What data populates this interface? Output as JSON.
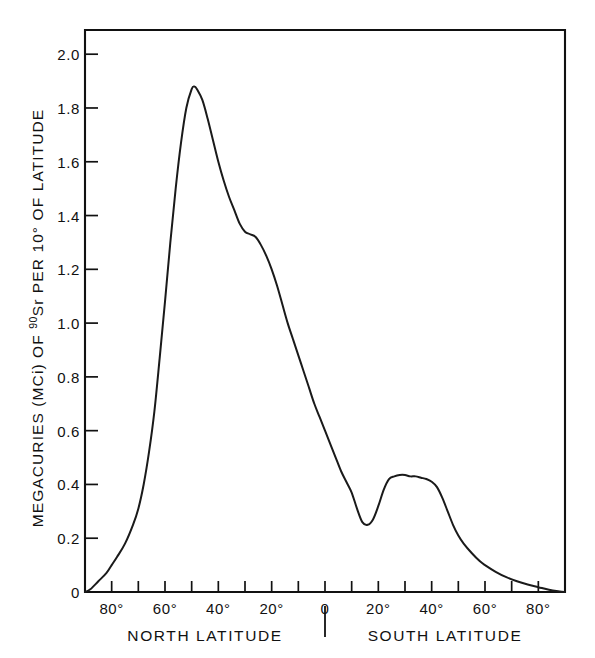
{
  "chart_data": {
    "type": "line",
    "title": "",
    "subtitle": "",
    "xlabel_left": "NORTH LATITUDE",
    "xlabel_right": "SOUTH LATITUDE",
    "ylabel": "MEGACURIES (MCi) OF 90Sr PER 10° OF LATITUDE",
    "ylabel_prefix": "MEGACURIES (MCi) OF ",
    "ylabel_superscript": "90",
    "ylabel_suffix": "Sr PER 10° OF LATITUDE",
    "legend": [],
    "grid": false,
    "xlim": [
      90,
      -90
    ],
    "ylim": [
      0,
      2.09
    ],
    "x_axis_direction": "north-to-south",
    "y_ticks": [
      0,
      0.2,
      0.4,
      0.6,
      0.8,
      1.0,
      1.2,
      1.4,
      1.6,
      1.8,
      2.0
    ],
    "y_tick_labels": [
      "0",
      "0.2",
      "0.4",
      "0.6",
      "0.8",
      "1.0",
      "1.2",
      "1.4",
      "1.6",
      "1.8",
      "2.0"
    ],
    "x_ticks": [
      90,
      80,
      70,
      60,
      50,
      40,
      30,
      20,
      10,
      0,
      -10,
      -20,
      -30,
      -40,
      -50,
      -60,
      -70,
      -80,
      -90
    ],
    "x_labeled_ticks": [
      80,
      60,
      40,
      20,
      0,
      -20,
      -40,
      -60,
      -80
    ],
    "x_tick_labels": [
      "80°",
      "60°",
      "40°",
      "20°",
      "0",
      "20°",
      "40°",
      "60°",
      "80°"
    ],
    "series": [
      {
        "name": "Sr-90 deposition",
        "x": [
          90,
          88,
          85,
          82,
          80,
          78,
          75,
          72,
          70,
          68,
          66,
          64,
          62,
          60,
          58,
          56,
          54,
          52,
          50,
          49,
          48,
          46,
          44,
          42,
          40,
          38,
          36,
          34,
          32,
          30,
          28,
          26,
          24,
          22,
          20,
          18,
          16,
          14,
          12,
          10,
          8,
          6,
          4,
          2,
          0,
          -2,
          -4,
          -6,
          -8,
          -10,
          -12,
          -14,
          -16,
          -18,
          -20,
          -22,
          -24,
          -26,
          -28,
          -30,
          -32,
          -34,
          -36,
          -38,
          -40,
          -42,
          -44,
          -46,
          -48,
          -50,
          -52,
          -55,
          -58,
          -60,
          -64,
          -68,
          -72,
          -76,
          -80,
          -84,
          -88,
          -90
        ],
        "y": [
          0.0,
          0.01,
          0.04,
          0.07,
          0.1,
          0.13,
          0.18,
          0.25,
          0.31,
          0.4,
          0.52,
          0.67,
          0.87,
          1.08,
          1.3,
          1.5,
          1.67,
          1.8,
          1.87,
          1.88,
          1.87,
          1.83,
          1.76,
          1.68,
          1.6,
          1.53,
          1.47,
          1.42,
          1.37,
          1.34,
          1.33,
          1.32,
          1.29,
          1.25,
          1.2,
          1.14,
          1.07,
          1.0,
          0.94,
          0.88,
          0.82,
          0.76,
          0.7,
          0.65,
          0.6,
          0.55,
          0.5,
          0.45,
          0.41,
          0.37,
          0.31,
          0.26,
          0.25,
          0.27,
          0.32,
          0.38,
          0.42,
          0.43,
          0.435,
          0.435,
          0.43,
          0.43,
          0.425,
          0.42,
          0.41,
          0.39,
          0.35,
          0.3,
          0.25,
          0.21,
          0.18,
          0.145,
          0.115,
          0.1,
          0.075,
          0.055,
          0.04,
          0.028,
          0.018,
          0.008,
          0.002,
          0.0
        ],
        "color": "#1a1a1a"
      }
    ],
    "annotations": {
      "peak_latitude": "49°N",
      "peak_value": 1.88,
      "shoulder_latitude": "26°N",
      "shoulder_value": 1.32,
      "trough_latitude": "16°S",
      "trough_value": 0.25,
      "secondary_peak_latitude": "28°S",
      "secondary_peak_value": 0.435
    },
    "colors": {
      "axis": "#111111",
      "curve": "#1a1a1a",
      "background": "#ffffff"
    }
  },
  "figure": {
    "divider_symbol": "|"
  }
}
